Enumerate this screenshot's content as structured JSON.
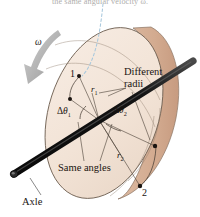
{
  "figure": {
    "background_color": "#ffffff",
    "caption_top": "the same angular velocity ω.",
    "disk": {
      "face_color": "#f2e4d8",
      "rim_color": "#d8b49a",
      "outline_color": "#7a6a5c",
      "shadow_color": "#e7d5c6"
    },
    "axle": {
      "color": "#151515",
      "highlight_color": "#5a5a5a",
      "label": "Axle"
    },
    "omega": {
      "symbol": "ω",
      "arrow_color": "#9b9b9b",
      "direction": "clockwise-down-left"
    },
    "points": [
      {
        "name": "point-1",
        "label": "1",
        "radius_label": "r",
        "radius_sub": "1"
      },
      {
        "name": "point-2",
        "label": "2",
        "radius_label": "r",
        "radius_sub": "2"
      }
    ],
    "angles": [
      {
        "name": "delta-theta-1",
        "delta": "Δ",
        "theta": "θ",
        "sub": "1"
      },
      {
        "name": "delta-theta-2",
        "delta": "Δ",
        "theta": "θ",
        "sub": "2"
      }
    ],
    "annotations": {
      "different_radii_line1": "Different",
      "different_radii_line2": "radii",
      "same_angles": "Same angles"
    },
    "leader_line": {
      "color": "#a8c8dd",
      "style": "dashed",
      "target": "point-1"
    }
  }
}
